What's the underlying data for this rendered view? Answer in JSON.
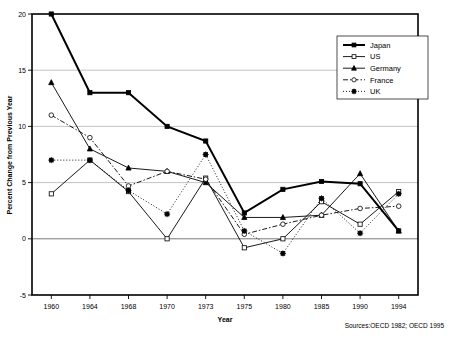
{
  "chart_data": {
    "type": "line",
    "title": "",
    "xlabel": "Year",
    "ylabel": "Percent Change from Previous Year",
    "categories": [
      "1960",
      "1964",
      "1968",
      "1970",
      "1973",
      "1975",
      "1980",
      "1985",
      "1990",
      "1994"
    ],
    "ylim": [
      -5,
      20
    ],
    "yticks": [
      -5,
      0,
      5,
      10,
      15,
      20
    ],
    "grid": true,
    "legend_position": "top-right",
    "series": [
      {
        "name": "Japan",
        "values": [
          20.0,
          13.0,
          13.0,
          10.0,
          8.7,
          2.3,
          4.4,
          5.1,
          4.9,
          0.7
        ],
        "marker": "filled-square",
        "dash": "solid",
        "width": 2.0
      },
      {
        "name": "US",
        "values": [
          4.0,
          7.0,
          4.2,
          0.0,
          5.4,
          -0.8,
          0.0,
          3.3,
          1.3,
          4.2
        ],
        "marker": "open-square",
        "dash": "solid",
        "width": 0.9
      },
      {
        "name": "Germany",
        "values": [
          13.9,
          8.0,
          6.3,
          6.0,
          5.0,
          1.9,
          1.9,
          2.1,
          5.8,
          0.7
        ],
        "marker": "filled-triangle",
        "dash": "solid",
        "width": 0.9
      },
      {
        "name": "France",
        "values": [
          11.0,
          9.0,
          4.7,
          6.0,
          5.3,
          0.4,
          1.3,
          2.1,
          2.7,
          2.9
        ],
        "marker": "open-circle",
        "dash": "dashdot",
        "width": 0.9
      },
      {
        "name": "UK",
        "values": [
          7.0,
          7.0,
          4.3,
          2.2,
          7.5,
          0.7,
          -1.3,
          3.6,
          0.5,
          4.0
        ],
        "marker": "filled-starsq",
        "dash": "dotted",
        "width": 0.9
      }
    ],
    "source_note": "Sources:OECD 1982; OECD 1995"
  },
  "legend": {
    "items": [
      {
        "label": "Japan"
      },
      {
        "label": "US"
      },
      {
        "label": "Germany"
      },
      {
        "label": "France"
      },
      {
        "label": "UK"
      }
    ]
  },
  "axes": {
    "x_title": "Year",
    "y_title": "Percent Change from Previous Year",
    "x_tick_labels": [
      "1960",
      "1964",
      "1968",
      "1970",
      "1973",
      "1975",
      "1980",
      "1985",
      "1990",
      "1994"
    ],
    "y_tick_labels": [
      "20",
      "15",
      "10",
      "5",
      "0",
      "-5"
    ]
  },
  "footer": {
    "source": "Sources:OECD 1982; OECD 1995"
  },
  "colors": {
    "ink": "#000000",
    "grid": "#9a9a9a",
    "background": "#ffffff"
  }
}
